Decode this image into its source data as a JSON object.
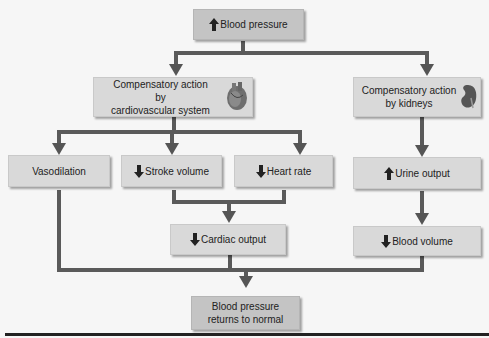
{
  "diagram": {
    "type": "flowchart",
    "nodes": {
      "top": {
        "arrow": "up",
        "label": "Blood pressure"
      },
      "cardio": {
        "label_line1": "Compensatory action by",
        "label_line2": "cardiovascular system",
        "icon": "heart-icon"
      },
      "kidney": {
        "label_line1": "Compensatory action",
        "label_line2": "by kidneys",
        "icon": "kidney-icon"
      },
      "vasodilation": {
        "label": "Vasodilation"
      },
      "stroke": {
        "arrow": "down",
        "label": "Stroke volume"
      },
      "heartrate": {
        "arrow": "down",
        "label": "Heart rate"
      },
      "urine": {
        "arrow": "up",
        "label": "Urine output"
      },
      "cardiac": {
        "arrow": "down",
        "label": "Cardiac output"
      },
      "bloodvol": {
        "arrow": "down",
        "label": "Blood volume"
      },
      "result": {
        "label_line1": "Blood pressure",
        "label_line2": "returns to normal"
      }
    },
    "edges": [
      [
        "top",
        "cardio"
      ],
      [
        "top",
        "kidney"
      ],
      [
        "cardio",
        "vasodilation"
      ],
      [
        "cardio",
        "stroke"
      ],
      [
        "cardio",
        "heartrate"
      ],
      [
        "stroke",
        "cardiac"
      ],
      [
        "heartrate",
        "cardiac"
      ],
      [
        "kidney",
        "urine"
      ],
      [
        "urine",
        "bloodvol"
      ],
      [
        "vasodilation",
        "result"
      ],
      [
        "cardiac",
        "result"
      ],
      [
        "bloodvol",
        "result"
      ]
    ],
    "colors": {
      "box": "#d9d9d9",
      "box_dark": "#c4c4c4",
      "connector": "#5a5a5a",
      "background": "#f7f7f7"
    }
  }
}
